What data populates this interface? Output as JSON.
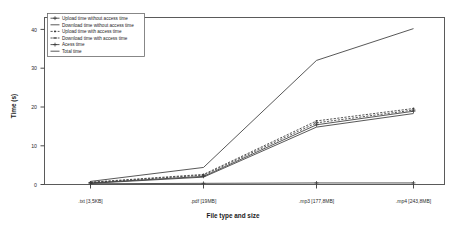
{
  "chart_data": {
    "type": "line",
    "title": "",
    "xlabel": "File type and size",
    "ylabel": "Time (s)",
    "categories": [
      ".txt [3,5KB]",
      ".pdf [19MB]",
      ".mp3 [177,8MB]",
      ".mp4 [243,8MB]"
    ],
    "ylim": [
      0,
      42
    ],
    "yticks": [
      "0",
      "10",
      "20",
      "30",
      "40"
    ],
    "ytick_values": [
      0,
      10,
      20,
      30,
      40
    ],
    "grid": false,
    "legend_position": "upper-left-inside",
    "series": [
      {
        "name": "Upload time without access time",
        "values": [
          0.4,
          2.1,
          15.4,
          18.9
        ],
        "marker": "plus",
        "dash": "solid"
      },
      {
        "name": "Download time without access time",
        "values": [
          0.3,
          1.9,
          14.8,
          18.3
        ],
        "marker": "none",
        "dash": "solid"
      },
      {
        "name": "Upload time with access time",
        "values": [
          0.6,
          2.6,
          16.4,
          19.6
        ],
        "marker": "dot",
        "dash": "dashed"
      },
      {
        "name": "Download time with access time",
        "values": [
          0.5,
          2.4,
          15.9,
          19.2
        ],
        "marker": "dash",
        "dash": "dashed"
      },
      {
        "name": "Acess time",
        "values": [
          0.2,
          0.3,
          0.4,
          0.4
        ],
        "marker": "plus",
        "dash": "solid"
      },
      {
        "name": "Total time",
        "values": [
          0.8,
          4.4,
          32.0,
          40.2
        ],
        "marker": "none",
        "dash": "solid"
      }
    ]
  },
  "axes": {
    "ylabel": "Time (s)",
    "xlabel": "File type and size"
  }
}
